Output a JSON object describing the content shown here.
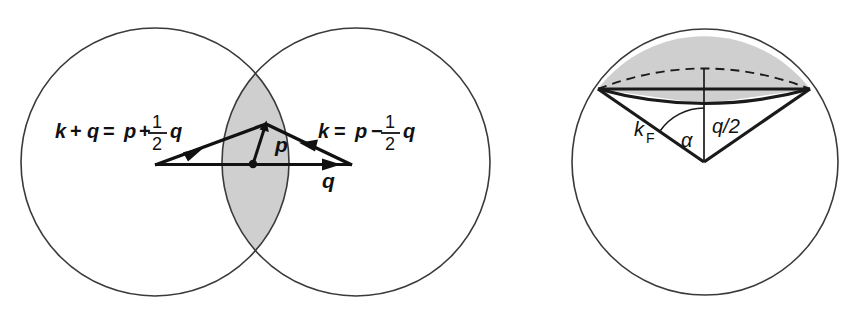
{
  "figure": {
    "colors": {
      "shade": "#cfcfcf",
      "outline": "#3a3a3a",
      "ink": "#111111",
      "background": "#ffffff"
    }
  },
  "left_panel": {
    "name": "overlapping-fermi-spheres",
    "labels": {
      "equation_left": {
        "lhs_k": "k",
        "op_plus": "+",
        "q_first": "q",
        "equals": "=",
        "p": "p",
        "op_sign": "+",
        "frac_numerator": "1",
        "frac_denominator": "2",
        "q_last": "q",
        "full_text": "k + q = p + 1/2 q"
      },
      "equation_right": {
        "lhs_k": "k",
        "equals": "=",
        "p": "p",
        "op_sign": "−",
        "frac_numerator": "1",
        "frac_denominator": "2",
        "q_last": "q",
        "full_text": "k = p − 1/2 q"
      },
      "vector_p": "p",
      "vector_q": "q"
    },
    "geometry": {
      "circle_left": {
        "cx": 155,
        "cy": 162,
        "r": 134
      },
      "circle_right": {
        "cx": 356,
        "cy": 162,
        "r": 134
      },
      "lens_top_crossing": {
        "x": 255,
        "y": 68
      },
      "lens_bottom_crossing": {
        "x": 255,
        "y": 252
      },
      "triangle_left_vertex": {
        "x": 155,
        "y": 165
      },
      "triangle_apex": {
        "x": 266,
        "y": 124
      },
      "triangle_right_vertex": {
        "x": 352,
        "y": 165
      },
      "origin_dot": {
        "x": 253,
        "y": 164
      }
    }
  },
  "right_panel": {
    "name": "fermi-sphere-cone",
    "labels": {
      "k_fermi_base": "k",
      "k_fermi_subscript": "F",
      "k_fermi_full": "k_F",
      "half_q": "q/2",
      "angle": "α"
    },
    "geometry": {
      "circle": {
        "cx": 705,
        "cy": 162,
        "r": 133
      },
      "cap_rim_left": {
        "x": 598,
        "y": 89
      },
      "cap_rim_right": {
        "x": 810,
        "y": 89
      },
      "cap_front_center": {
        "x": 704,
        "y": 104
      },
      "cone_vertex": {
        "x": 704,
        "y": 162
      },
      "dashed_rim_peak": {
        "x": 704,
        "y": 68
      }
    }
  }
}
